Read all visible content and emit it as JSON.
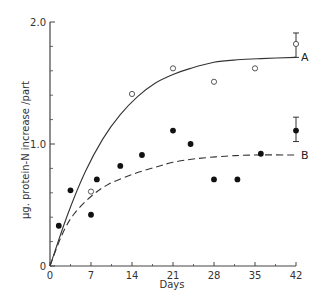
{
  "chart_data": {
    "type": "scatter",
    "title": "",
    "xlabel": "Days",
    "ylabel": "μg. protein-N increase /part",
    "xlim": [
      0,
      42
    ],
    "ylim": [
      0,
      2.0
    ],
    "x_ticks": [
      0,
      7,
      14,
      21,
      28,
      35,
      42
    ],
    "x_tick_labels": [
      "0",
      "7",
      "14",
      "21",
      "28",
      "35",
      "42"
    ],
    "y_ticks": [
      0,
      1.0,
      2.0
    ],
    "y_tick_labels": [
      "0",
      "1.0",
      "2.0"
    ],
    "y_minor_ticks": [
      0.2,
      0.4,
      0.6,
      0.8,
      1.2,
      1.4,
      1.6,
      1.8
    ],
    "grid": false,
    "series": [
      {
        "name": "A",
        "marker": "open-circle",
        "points": [
          {
            "x": 7,
            "y": 0.61
          },
          {
            "x": 14,
            "y": 1.41
          },
          {
            "x": 21,
            "y": 1.62
          },
          {
            "x": 28,
            "y": 1.51
          },
          {
            "x": 35,
            "y": 1.62
          },
          {
            "x": 42,
            "y": 1.82,
            "err_low": 1.71,
            "err_high": 1.91
          }
        ],
        "curve": {
          "style": "solid",
          "points": [
            [
              0,
              0
            ],
            [
              3,
              0.42
            ],
            [
              6,
              0.77
            ],
            [
              9,
              1.04
            ],
            [
              12,
              1.24
            ],
            [
              15,
              1.39
            ],
            [
              18,
              1.5
            ],
            [
              21,
              1.57
            ],
            [
              24,
              1.62
            ],
            [
              28,
              1.67
            ],
            [
              32,
              1.69
            ],
            [
              36,
              1.7
            ],
            [
              42,
              1.71
            ]
          ]
        }
      },
      {
        "name": "B",
        "marker": "filled-circle",
        "points": [
          {
            "x": 1.5,
            "y": 0.33
          },
          {
            "x": 3.5,
            "y": 0.62
          },
          {
            "x": 7,
            "y": 0.42
          },
          {
            "x": 8,
            "y": 0.71
          },
          {
            "x": 12,
            "y": 0.82
          },
          {
            "x": 15.7,
            "y": 0.91
          },
          {
            "x": 21,
            "y": 1.11
          },
          {
            "x": 24,
            "y": 1.0
          },
          {
            "x": 28,
            "y": 0.71
          },
          {
            "x": 32,
            "y": 0.71
          },
          {
            "x": 36,
            "y": 0.92
          },
          {
            "x": 42,
            "y": 1.11,
            "err_low": 1.02,
            "err_high": 1.22
          }
        ],
        "curve": {
          "style": "dashed",
          "points": [
            [
              0,
              0
            ],
            [
              2,
              0.25
            ],
            [
              4,
              0.42
            ],
            [
              7,
              0.57
            ],
            [
              10,
              0.67
            ],
            [
              14,
              0.75
            ],
            [
              18,
              0.81
            ],
            [
              21,
              0.85
            ],
            [
              25,
              0.88
            ],
            [
              30,
              0.9
            ],
            [
              35,
              0.91
            ],
            [
              42,
              0.91
            ]
          ]
        }
      }
    ],
    "annotations": [
      {
        "text": "A",
        "x": 42,
        "y": 1.71
      },
      {
        "text": "B",
        "x": 42,
        "y": 0.91
      }
    ]
  }
}
